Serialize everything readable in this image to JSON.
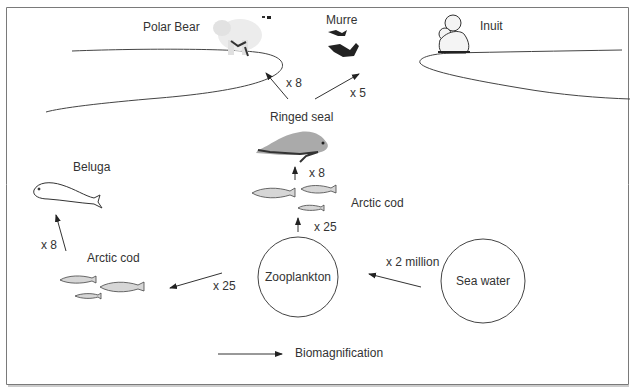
{
  "diagram": {
    "type": "food-web-biomagnification",
    "nodes": {
      "polar_bear": {
        "label": "Polar Bear"
      },
      "murre": {
        "label": "Murre"
      },
      "inuit": {
        "label": "Inuit"
      },
      "ringed_seal": {
        "label": "Ringed seal"
      },
      "beluga": {
        "label": "Beluga"
      },
      "arctic_cod_center": {
        "label": "Arctic cod"
      },
      "arctic_cod_left": {
        "label": "Arctic cod"
      },
      "zooplankton": {
        "label": "Zooplankton"
      },
      "sea_water": {
        "label": "Sea water"
      }
    },
    "edges": [
      {
        "from": "sea_water",
        "to": "zooplankton",
        "label": "x 2 million"
      },
      {
        "from": "zooplankton",
        "to": "arctic_cod_center",
        "label": "x 25"
      },
      {
        "from": "zooplankton",
        "to": "arctic_cod_left",
        "label": "x 25"
      },
      {
        "from": "arctic_cod_center",
        "to": "ringed_seal",
        "label": "x 8"
      },
      {
        "from": "arctic_cod_left",
        "to": "beluga",
        "label": "x 8"
      },
      {
        "from": "ringed_seal",
        "to": "polar_bear",
        "label": "x 8"
      },
      {
        "from": "ringed_seal",
        "to": "murre",
        "label": "x 5"
      }
    ],
    "legend": {
      "label": "Biomagnification"
    }
  }
}
